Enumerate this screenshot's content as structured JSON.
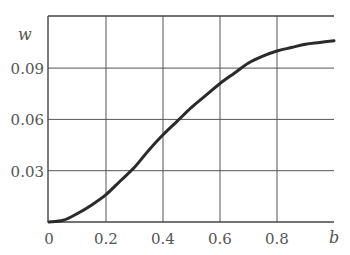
{
  "chart_data": {
    "type": "line",
    "title": "",
    "xlabel": "b",
    "ylabel": "w",
    "xlim": [
      0,
      1.0
    ],
    "ylim": [
      0,
      0.12
    ],
    "grid": true,
    "x_ticks": [
      "0",
      "0.2",
      "0.4",
      "0.6",
      "0.8"
    ],
    "y_ticks": [
      "0.03",
      "0.06",
      "0.09"
    ],
    "series": [
      {
        "name": "w(b)",
        "x": [
          0,
          0.05,
          0.1,
          0.15,
          0.2,
          0.25,
          0.3,
          0.35,
          0.4,
          0.45,
          0.5,
          0.55,
          0.6,
          0.65,
          0.7,
          0.75,
          0.8,
          0.85,
          0.9,
          0.95,
          1.0
        ],
        "values": [
          0,
          0.001,
          0.005,
          0.01,
          0.016,
          0.024,
          0.032,
          0.042,
          0.051,
          0.059,
          0.067,
          0.074,
          0.081,
          0.087,
          0.093,
          0.097,
          0.1,
          0.102,
          0.104,
          0.105,
          0.106
        ]
      }
    ]
  },
  "labels": {
    "y_axis": "w",
    "x_axis": "b",
    "x_ticks": [
      "0",
      "0.2",
      "0.4",
      "0.6",
      "0.8"
    ],
    "y_ticks": [
      "0.03",
      "0.06",
      "0.09"
    ]
  }
}
